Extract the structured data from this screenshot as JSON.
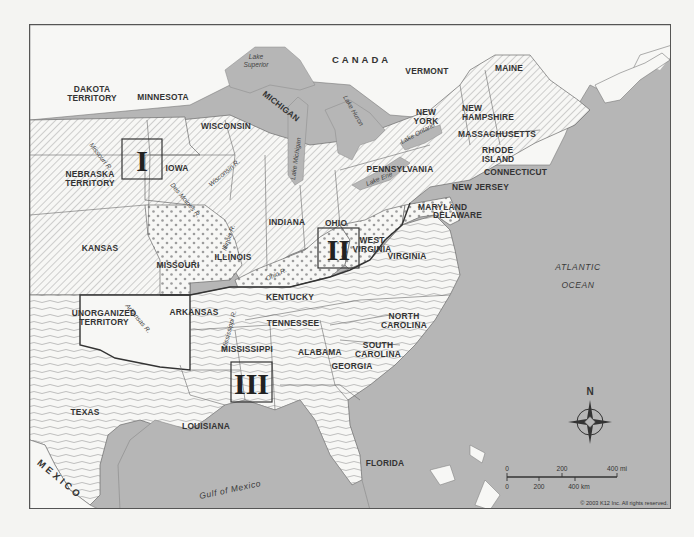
{
  "map": {
    "copyright": "© 2003 K12 Inc. All rights reserved.",
    "colors": {
      "water": "#b6b6b6",
      "land": "#f7f7f5",
      "border": "#6a6a6a",
      "frame": "#555555",
      "text": "#333333"
    },
    "regions": {
      "canada": "CANADA",
      "mexico": "MEXICO"
    },
    "water_labels": {
      "atlantic_1": "ATLANTIC",
      "atlantic_2": "OCEAN",
      "gulf": "Gulf of Mexico",
      "lake_superior_1": "Lake",
      "lake_superior_2": "Superior",
      "lake_michigan": "Lake Michigan",
      "lake_huron": "Lake Huron",
      "lake_erie": "Lake Erie",
      "lake_ontario": "Lake Ontario"
    },
    "rivers": {
      "missouri": "Missouri R.",
      "des_moines": "Des Moines R.",
      "wisconsin": "Wisconsin R.",
      "illinois": "Illinois R.",
      "ohio": "Ohio R.",
      "arkansas": "Arkansas R.",
      "mississippi": "Mississippi R."
    },
    "states": {
      "dakota_1": "DAKOTA",
      "dakota_2": "TERRITORY",
      "minnesota": "MINNESOTA",
      "wisconsin": "WISCONSIN",
      "michigan": "MICHIGAN",
      "iowa": "IOWA",
      "nebraska_1": "NEBRASKA",
      "nebraska_2": "TERRITORY",
      "kansas": "KANSAS",
      "missouri": "MISSOURI",
      "illinois": "ILLINOIS",
      "indiana": "INDIANA",
      "ohio": "OHIO",
      "kentucky": "KENTUCKY",
      "west_virginia_1": "WEST",
      "west_virginia_2": "VIRGINIA",
      "virginia": "VIRGINIA",
      "pennsylvania": "PENNSYLVANIA",
      "new_york_1": "NEW",
      "new_york_2": "YORK",
      "vermont": "VERMONT",
      "maine": "MAINE",
      "new_hampshire_1": "NEW",
      "new_hampshire_2": "HAMPSHIRE",
      "massachusetts": "MASSACHUSETTS",
      "rhode_island_1": "RHODE",
      "rhode_island_2": "ISLAND",
      "connecticut": "CONNECTICUT",
      "new_jersey": "NEW JERSEY",
      "maryland": "MARYLAND",
      "delaware": "DELAWARE",
      "unorganized_1": "UNORGANIZED",
      "unorganized_2": "TERRITORY",
      "arkansas": "ARKANSAS",
      "tennessee": "TENNESSEE",
      "north_carolina_1": "NORTH",
      "north_carolina_2": "CAROLINA",
      "south_carolina_1": "SOUTH",
      "south_carolina_2": "CAROLINA",
      "mississippi": "MISSISSIPPI",
      "alabama": "ALABAMA",
      "georgia": "GEORGIA",
      "texas": "TEXAS",
      "louisiana": "LOUISIANA",
      "florida": "FLORIDA"
    },
    "region_markers": [
      {
        "id": "I",
        "label": "I"
      },
      {
        "id": "II",
        "label": "II"
      },
      {
        "id": "III",
        "label": "III"
      }
    ],
    "compass": {
      "north_label": "N"
    },
    "scale_bar": {
      "miles": {
        "ticks": [
          "0",
          "200",
          "400 mi"
        ]
      },
      "km": {
        "ticks": [
          "0",
          "200",
          "400 km"
        ]
      }
    },
    "legend_patterns": {
      "free_states": "diagonal-hatch",
      "border_states": "dots",
      "confederate_states": "wavy-lines"
    }
  }
}
